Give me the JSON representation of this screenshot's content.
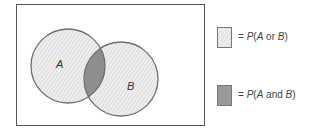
{
  "diagram": {
    "type": "venn",
    "universe_box": {
      "x": 16,
      "y": 4,
      "width": 189,
      "height": 122,
      "stroke": "#555555"
    },
    "circles": [
      {
        "label": "A",
        "cx": 68,
        "cy": 66,
        "r": 37
      },
      {
        "label": "B",
        "cx": 121,
        "cy": 79,
        "r": 37
      }
    ],
    "colors": {
      "circle_stroke": "#6f6f6f",
      "union_fill": "#ececec",
      "hatch_line": "#c8c8c8",
      "intersection_fill": "#8e8e8e"
    }
  },
  "labels": {
    "circle_a": "A",
    "circle_b": "B"
  },
  "legend": [
    {
      "swatch": "hatched-light",
      "equals": "=",
      "prefix": "P(",
      "var1": "A",
      "conj": " or ",
      "var2": "B",
      "suffix": ")"
    },
    {
      "swatch": "solid-gray",
      "equals": "=",
      "prefix": "P(",
      "var1": "A",
      "conj": " and ",
      "var2": "B",
      "suffix": ")"
    }
  ]
}
